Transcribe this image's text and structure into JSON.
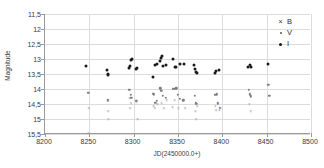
{
  "chart_data": {
    "type": "scatter",
    "title": "",
    "xlabel": "JD(2450000.0+)",
    "ylabel": "Magnitude",
    "xlim": [
      8200,
      8500
    ],
    "ylim": [
      15.5,
      11.5
    ],
    "y_inverted": true,
    "xticks": [
      8200,
      8250,
      8300,
      8350,
      8400,
      8450,
      8500
    ],
    "yticks": [
      11.5,
      12,
      12.5,
      13,
      13.5,
      14,
      14.5,
      15,
      15.5
    ],
    "xtick_labels": [
      "8200",
      "8250",
      "8300",
      "8350",
      "8400",
      "8450",
      "8500"
    ],
    "ytick_labels": [
      "11,5",
      "12",
      "12,5",
      "13",
      "13,5",
      "14",
      "14,5",
      "15",
      "15,5"
    ],
    "grid": true,
    "legend_position": "top-right",
    "series": [
      {
        "name": "B",
        "marker": "x",
        "color": "#9e9e9e",
        "points": [
          [
            8249.5,
            14.62
          ],
          [
            8271.0,
            14.38
          ],
          [
            8271.5,
            15.0
          ],
          [
            8271.0,
            14.72
          ],
          [
            8295.5,
            14.3
          ],
          [
            8296.0,
            14.62
          ],
          [
            8297.0,
            14.45
          ],
          [
            8303.0,
            14.42
          ],
          [
            8304.5,
            14.99
          ],
          [
            8322.5,
            14.55
          ],
          [
            8324.0,
            14.62
          ],
          [
            8327.0,
            14.5
          ],
          [
            8331.5,
            14.45
          ],
          [
            8334.0,
            14.62
          ],
          [
            8337.0,
            14.38
          ],
          [
            8344.0,
            14.6
          ],
          [
            8346.0,
            14.38
          ],
          [
            8350.5,
            14.62
          ],
          [
            8358.0,
            14.62
          ],
          [
            8369.5,
            14.72
          ],
          [
            8370.5,
            15.0
          ],
          [
            8371.5,
            14.55
          ],
          [
            8392.0,
            14.58
          ],
          [
            8393.0,
            14.7
          ],
          [
            8396.5,
            14.7
          ],
          [
            8398.0,
            14.62
          ],
          [
            8430.5,
            14.5
          ],
          [
            8432.0,
            14.72
          ],
          [
            8249.0,
            15.46
          ]
        ]
      },
      {
        "name": "V",
        "marker": "dot-small",
        "color": "#7d7d7d",
        "points": [
          [
            8249.0,
            14.12
          ],
          [
            8271.0,
            14.38
          ],
          [
            8295.0,
            14.03
          ],
          [
            8296.5,
            14.2
          ],
          [
            8297.5,
            14.3
          ],
          [
            8303.0,
            14.4
          ],
          [
            8322.0,
            14.15
          ],
          [
            8323.0,
            14.2
          ],
          [
            8324.5,
            14.45
          ],
          [
            8326.0,
            14.4
          ],
          [
            8330.0,
            13.98
          ],
          [
            8331.0,
            14.05
          ],
          [
            8333.0,
            14.22
          ],
          [
            8336.0,
            14.3
          ],
          [
            8344.0,
            14.0
          ],
          [
            8346.0,
            14.0
          ],
          [
            8348.0,
            13.98
          ],
          [
            8350.0,
            14.2
          ],
          [
            8352.0,
            14.32
          ],
          [
            8356.0,
            14.38
          ],
          [
            8369.0,
            14.22
          ],
          [
            8370.0,
            14.48
          ],
          [
            8371.0,
            14.5
          ],
          [
            8392.0,
            14.2
          ],
          [
            8394.0,
            14.18
          ],
          [
            8395.0,
            14.48
          ],
          [
            8397.0,
            14.62
          ],
          [
            8430.0,
            14.02
          ],
          [
            8431.0,
            14.18
          ],
          [
            8432.0,
            14.24
          ],
          [
            8452.0,
            13.86
          ],
          [
            8453.0,
            14.22
          ]
        ]
      },
      {
        "name": "I",
        "marker": "dot",
        "color": "#1a1a1a",
        "points": [
          [
            8246.5,
            13.23
          ],
          [
            8269.5,
            13.35
          ],
          [
            8270.5,
            13.5
          ],
          [
            8271.0,
            13.52
          ],
          [
            8294.5,
            13.3
          ],
          [
            8295.5,
            13.22
          ],
          [
            8297.0,
            13.03
          ],
          [
            8298.0,
            13.0
          ],
          [
            8303.0,
            13.32
          ],
          [
            8304.0,
            13.3
          ],
          [
            8322.0,
            13.6
          ],
          [
            8324.5,
            13.2
          ],
          [
            8326.0,
            13.18
          ],
          [
            8329.5,
            13.05
          ],
          [
            8330.5,
            12.95
          ],
          [
            8331.5,
            12.9
          ],
          [
            8333.0,
            13.22
          ],
          [
            8336.5,
            13.2
          ],
          [
            8344.5,
            13.0
          ],
          [
            8346.5,
            13.25
          ],
          [
            8348.0,
            13.25
          ],
          [
            8352.0,
            13.18
          ],
          [
            8356.5,
            13.17
          ],
          [
            8368.0,
            13.2
          ],
          [
            8369.5,
            13.32
          ],
          [
            8370.5,
            13.42
          ],
          [
            8371.5,
            13.45
          ],
          [
            8391.5,
            13.45
          ],
          [
            8393.0,
            13.4
          ],
          [
            8396.5,
            13.37
          ],
          [
            8429.5,
            13.25
          ],
          [
            8431.0,
            13.2
          ],
          [
            8432.0,
            13.28
          ],
          [
            8452.0,
            13.15
          ]
        ]
      }
    ],
    "legend": [
      {
        "label": "B",
        "marker": "x"
      },
      {
        "label": "V",
        "marker": "dot-small"
      },
      {
        "label": "I",
        "marker": "dot"
      }
    ]
  }
}
